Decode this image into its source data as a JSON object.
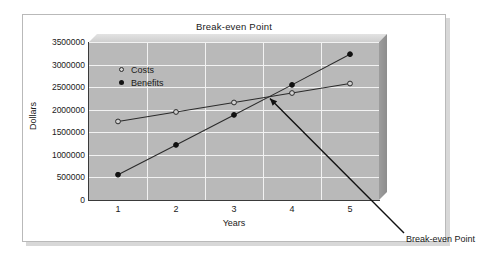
{
  "chart_data": {
    "type": "line",
    "title": "Break-even Point",
    "xlabel": "Years",
    "ylabel": "Dollars",
    "categories": [
      "1",
      "2",
      "3",
      "4",
      "5"
    ],
    "x": [
      1,
      2,
      3,
      4,
      5
    ],
    "ylim": [
      0,
      3500000
    ],
    "yticks": [
      0,
      500000,
      1000000,
      1500000,
      2000000,
      2500000,
      3000000,
      3500000
    ],
    "ytick_labels": [
      "0",
      "500000",
      "1000000",
      "1500000",
      "2000000",
      "2500000",
      "3000000",
      "3500000"
    ],
    "grid": true,
    "legend_position": "upper-left-inside",
    "series": [
      {
        "name": "Costs",
        "marker": "open-circle",
        "values": [
          1740000,
          1950000,
          2160000,
          2370000,
          2580000
        ]
      },
      {
        "name": "Benefits",
        "marker": "filled-circle",
        "values": [
          560000,
          1220000,
          1885000,
          2550000,
          3230000
        ]
      }
    ],
    "annotations": [
      {
        "text": "Break-even Point",
        "point_x": 3.62,
        "point_y": 2250000,
        "label_x": 5.55,
        "label_y": -400000
      }
    ],
    "colors": {
      "plot_background": "#b9b9b9",
      "gridline": "#f2f2f2",
      "axis": "#3a3a3a",
      "series_line": "#2b2b2b",
      "text": "#1a1a1a",
      "card_background": "#ffffff",
      "card_border": "#b9b9b9"
    }
  },
  "legend": {
    "costs_label": "Costs",
    "benefits_label": "Benefits"
  },
  "axes": {
    "y_title": "Dollars",
    "x_title": "Years"
  },
  "title": "Break-even Point",
  "annotation_label": "Break-even Point"
}
